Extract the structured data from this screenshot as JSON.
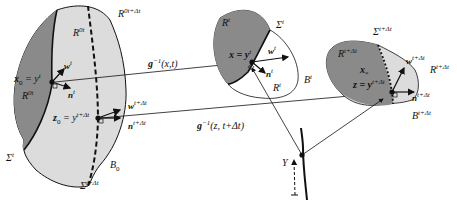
{
  "figure": {
    "colors": {
      "dark_region": "#8a8a8a",
      "light_region": "#dcdcdc",
      "outline": "#111111",
      "background": "#ffffff"
    },
    "reference_body": {
      "region_plus_t": {
        "base": "R",
        "sub": "+",
        "sup": "0t"
      },
      "region_plus_tdt": {
        "base": "R",
        "sub": "+",
        "sup": "0t+Δt"
      },
      "region_minus": {
        "base": "R",
        "sub": "−",
        "sup": "0t"
      },
      "point_x0": {
        "text": "x",
        "sub": "0",
        "eq": " = y",
        "eq_sub": "0",
        "eq_sup": "t"
      },
      "w0t": {
        "base": "w",
        "sub": "0",
        "sup": "t"
      },
      "n0t": {
        "base": "n",
        "sub": "0",
        "sup": "t"
      },
      "point_z0": {
        "text": "z",
        "sub": "0",
        "eq": " = y",
        "eq_sub": "0",
        "eq_sup": "t+Δt"
      },
      "w0tdt": {
        "base": "w",
        "sub": "0",
        "sup": "t+Δt"
      },
      "n0tdt": {
        "base": "n",
        "sub": "0",
        "sup": "t+Δt"
      },
      "sigma0t": {
        "base": "Σ",
        "sub": "0",
        "sup": "t"
      },
      "sigma0tdt": {
        "base": "Σ",
        "sub": "0",
        "sup": "t+Δt"
      },
      "body": {
        "base": "B",
        "sub": "0"
      }
    },
    "map_labels": {
      "g_inv_x_t": {
        "base": "g",
        "sup": "−1",
        "args": "(x,t)"
      },
      "g_inv_z_tdt": {
        "base": "g",
        "sup": "−1",
        "args": "(z, t+Δt)"
      }
    },
    "config_t": {
      "region_minus": {
        "base": "R",
        "sub": "−",
        "sup": "t"
      },
      "sigma": {
        "base": "Σ",
        "sup": "t"
      },
      "point": {
        "text": "x = y",
        "sup": "t"
      },
      "w": {
        "base": "w",
        "sup": "t"
      },
      "n": {
        "base": "n",
        "sup": "t"
      },
      "region_plus": {
        "base": "R",
        "sub": "+",
        "sup": "t"
      },
      "body": {
        "base": "B",
        "sup": "t"
      }
    },
    "config_tdt": {
      "sigma": {
        "base": "Σ",
        "sup": "t+Δt"
      },
      "region_minus": {
        "base": "R",
        "sub": "−",
        "sup": "t+Δt"
      },
      "x_star": {
        "base": "x",
        "sub": "*"
      },
      "point": {
        "text": "z = y",
        "sup": "t+Δt"
      },
      "w": {
        "base": "w",
        "sup": "t+Δt"
      },
      "n": {
        "base": "n",
        "sup": "t+Δt"
      },
      "region_plus": {
        "base": "R",
        "sub": "+",
        "sup": "t+Δt"
      },
      "body": {
        "base": "B",
        "sup": "t+Δt"
      }
    },
    "path_label": {
      "base": "Y"
    }
  }
}
